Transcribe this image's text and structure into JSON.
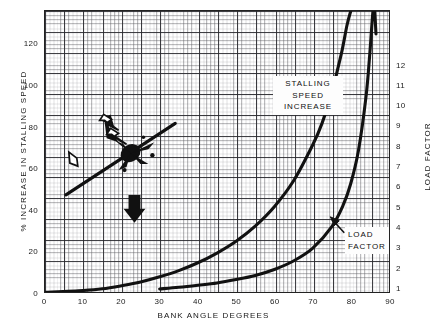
{
  "chart_data": {
    "type": "line",
    "title": "",
    "xlabel": "BANK ANGLE DEGREES",
    "ylabel": "% INCREASE IN STALLING SPEED",
    "y2label": "LOAD FACTOR",
    "xlim": [
      0,
      90
    ],
    "ylim": [
      0,
      136
    ],
    "y2lim": [
      1,
      13.3
    ],
    "grid": true,
    "legend_position": "in-plot annotations",
    "xticks": [
      0,
      10,
      20,
      30,
      40,
      50,
      60,
      70,
      80,
      90
    ],
    "yticks": [
      0,
      20,
      40,
      60,
      80,
      100,
      120
    ],
    "y2ticks": [
      1,
      2,
      3,
      4,
      5,
      6,
      7,
      8,
      9,
      10,
      11,
      12
    ],
    "series": [
      {
        "name": "STALLING SPEED INCREASE",
        "axis": "left",
        "x": [
          0,
          10,
          15,
          20,
          25,
          30,
          35,
          40,
          45,
          50,
          55,
          60,
          65,
          70,
          72.5,
          75,
          77.5,
          79,
          80
        ],
        "values": [
          0,
          0.9,
          1.7,
          3.2,
          5.0,
          7.5,
          10.5,
          14.3,
          19.0,
          24.7,
          32.0,
          41.4,
          53.8,
          71.1,
          81.8,
          96.6,
          115.0,
          129.0,
          136.0
        ]
      },
      {
        "name": "LOAD FACTOR",
        "axis": "right",
        "x": [
          30,
          35,
          40,
          45,
          50,
          55,
          60,
          65,
          70,
          75,
          78,
          80,
          82,
          84,
          85,
          86,
          86.6
        ],
        "values": [
          1.15,
          1.22,
          1.31,
          1.41,
          1.56,
          1.74,
          2.0,
          2.37,
          2.92,
          3.86,
          4.81,
          5.76,
          7.19,
          9.57,
          11.47,
          14.34,
          12.3
        ]
      }
    ],
    "annotations": [
      {
        "name": "stalling-speed-increase",
        "text": "STALLING SPEED INCREASE",
        "lines": [
          "STALLING",
          "SPEED",
          "INCREASE"
        ]
      },
      {
        "name": "load-factor",
        "text": "LOAD FACTOR",
        "lines": [
          "LOAD",
          "FACTOR"
        ]
      },
      {
        "name": "banked-aircraft-diagram",
        "text": ""
      }
    ],
    "colors": {
      "curve": "#111111",
      "grid_major": "#2a2a2d",
      "grid_minor": "#5a5a5f",
      "background": "#ffffff"
    }
  },
  "axes": {
    "x": {
      "title": "BANK ANGLE DEGREES",
      "ticks": [
        "0",
        "10",
        "20",
        "30",
        "40",
        "50",
        "60",
        "70",
        "80",
        "90"
      ]
    },
    "y_left": {
      "title": "% INCREASE IN STALLING SPEED",
      "ticks": [
        "0",
        "20",
        "40",
        "60",
        "80",
        "100",
        "120"
      ]
    },
    "y_right": {
      "title": "LOAD FACTOR",
      "ticks": [
        "1",
        "2",
        "3",
        "4",
        "5",
        "6",
        "7",
        "8",
        "9",
        "10",
        "11",
        "12"
      ]
    }
  },
  "callouts": {
    "stalling": {
      "l1": "STALLING",
      "l2": "SPEED",
      "l3": "INCREASE"
    },
    "load": {
      "l1": "LOAD",
      "l2": "FACTOR"
    }
  }
}
